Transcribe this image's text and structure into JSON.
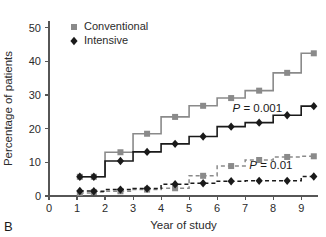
{
  "panel": {
    "label": "B"
  },
  "chart_data": {
    "type": "line",
    "subtype": "step-kaplan-meier",
    "title": "",
    "xlabel": "Year of study",
    "ylabel": "Percentage of patients",
    "xlim": [
      0,
      9.6
    ],
    "ylim": [
      0,
      52
    ],
    "xticks": [
      0,
      1,
      2,
      3,
      4,
      5,
      6,
      7,
      8,
      9
    ],
    "xticklabels": [
      "0",
      "1",
      "2",
      "3",
      "4",
      "5",
      "6",
      "7",
      "8",
      "9"
    ],
    "yticks": [
      0,
      10,
      20,
      30,
      40,
      50
    ],
    "yticklabels": [
      "0",
      "10",
      "20",
      "30",
      "40",
      "50"
    ],
    "grid": false,
    "legend_position": "upper-left",
    "series": [
      {
        "name": "Conventional",
        "marker": "square",
        "linestyle": "solid",
        "color": "#8a8a8a",
        "x": [
          1.1,
          1.6,
          2.55,
          3.5,
          4.5,
          5.5,
          6.5,
          7.5,
          8.5,
          9.45
        ],
        "values": [
          5.7,
          5.7,
          13.0,
          18.5,
          23.5,
          26.8,
          29.1,
          31.3,
          36.6,
          42.4
        ]
      },
      {
        "name": "Intensive",
        "marker": "diamond",
        "linestyle": "solid",
        "color": "#1a1a1a",
        "x": [
          1.1,
          1.6,
          2.55,
          3.5,
          4.5,
          5.5,
          6.5,
          7.5,
          8.5,
          9.45
        ],
        "values": [
          5.7,
          5.7,
          10.4,
          13.1,
          15.5,
          17.7,
          20.6,
          21.8,
          24.0,
          26.7
        ]
      },
      {
        "name": "Conventional",
        "marker": "square",
        "linestyle": "dashed",
        "color": "#8a8a8a",
        "x": [
          1.1,
          1.6,
          2.55,
          3.5,
          4.5,
          5.5,
          6.5,
          7.5,
          8.5,
          9.45
        ],
        "values": [
          0.9,
          1.2,
          1.4,
          1.9,
          2.3,
          6.0,
          8.9,
          10.7,
          11.6,
          11.8
        ]
      },
      {
        "name": "Intensive",
        "marker": "diamond",
        "linestyle": "dashed",
        "color": "#1a1a1a",
        "x": [
          1.1,
          1.6,
          2.55,
          3.5,
          4.5,
          5.5,
          6.5,
          7.5,
          8.5,
          9.45
        ],
        "values": [
          1.5,
          1.4,
          1.9,
          2.2,
          3.5,
          3.8,
          4.4,
          4.5,
          4.5,
          5.8
        ]
      }
    ],
    "legend": [
      {
        "label": "Conventional",
        "marker": "square",
        "color": "#8a8a8a"
      },
      {
        "label": "Intensive",
        "marker": "diamond",
        "color": "#1a1a1a"
      }
    ],
    "annotations": [
      {
        "text_italic": "P",
        "text": " = 0.001",
        "x": 6.55,
        "y": 25.0
      },
      {
        "text_italic": "P",
        "text": " = 0.01",
        "x": 7.15,
        "y": 8.0
      }
    ],
    "colors": {
      "conventional": "#8a8a8a",
      "intensive": "#1a1a1a",
      "axis": "#565656",
      "background": "#ffffff"
    }
  }
}
